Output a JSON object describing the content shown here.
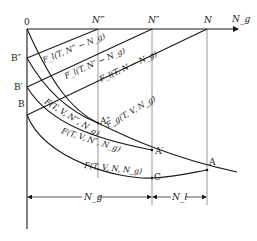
{
  "diagram": {
    "axis": {
      "origin_label": "0",
      "x_axis_label": "N_g",
      "x_ticks": [
        "N‴",
        "N″",
        "N"
      ]
    },
    "left_points": [
      "B″",
      "B′",
      "B"
    ],
    "curve_points": [
      "A″",
      "A′",
      "A",
      "C"
    ],
    "line_labels": {
      "f1": "F_l(T, N‴ − N_g)",
      "f2": "F_l(T, N″ − N_g)",
      "f3": "F_l(T, N − N_g)"
    },
    "curve_labels": {
      "c1": "F(T, V, N‴, N_g)",
      "c2": "F(T, V, N″, N_g)",
      "c3": "F(T, V, N, N_g)",
      "cg": "F_g(T, V, N_g)"
    },
    "dimensions": {
      "ng": "N_g",
      "nl": "N_l"
    }
  }
}
